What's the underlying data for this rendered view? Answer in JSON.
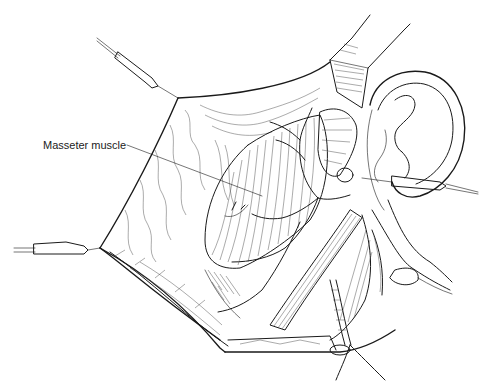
{
  "figure": {
    "labels": [
      {
        "id": "masseter",
        "text": "Masseter muscle",
        "x": 43,
        "y": 139,
        "leader_to": [
          262,
          196
        ]
      }
    ],
    "colors": {
      "ink": "#1a1a1a",
      "background": "#ffffff"
    }
  }
}
